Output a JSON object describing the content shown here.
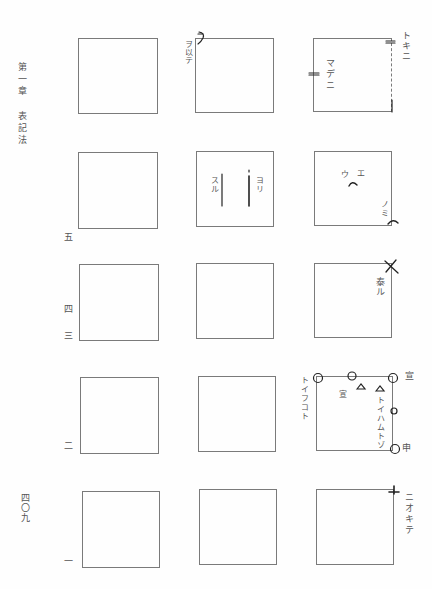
{
  "margin": {
    "chapter_heading": "第一章 表記法",
    "page_number": "四〇九",
    "row_numbers": [
      "五",
      "四",
      "三",
      "二",
      "一"
    ]
  },
  "grid": {
    "rows": 5,
    "cols": 3,
    "annotations": {
      "r1c2": {
        "left_label": "ヲ以テ",
        "corner_mark": "ヲコト点 (hook) top-left"
      },
      "r1c3": {
        "inside_label": "マデニ",
        "right_label": "トキニ",
        "marks": [
          "double-tick left edge",
          "double-tick top-right"
        ]
      },
      "r2c2": {
        "left_inner_label": "スル",
        "right_inner_label": "ヨリ",
        "marks": [
          "vertical line",
          "vertical line"
        ]
      },
      "r2c3": {
        "top_labels": [
          "ウ",
          "エ"
        ],
        "bottom_right_label": "ノミ",
        "marks": [
          "caret center",
          "caret bottom-right"
        ]
      },
      "r3c3": {
        "right_label": "泰ル",
        "marks": [
          "cross top-right"
        ]
      },
      "r4c3": {
        "left_label": "トイフコト",
        "inner_label_left": "宣",
        "inner_label_right": "トイハムトゾ",
        "right_top_label": "宣",
        "right_bottom_label": "申",
        "marks": [
          "circle top-left",
          "circle top-middle",
          "circle top-right",
          "small circle right-middle",
          "circle bottom-right",
          "triangle",
          "triangle"
        ]
      },
      "r5c3": {
        "right_label": "ニオキテ",
        "marks": [
          "T-mark top-right"
        ]
      }
    }
  }
}
